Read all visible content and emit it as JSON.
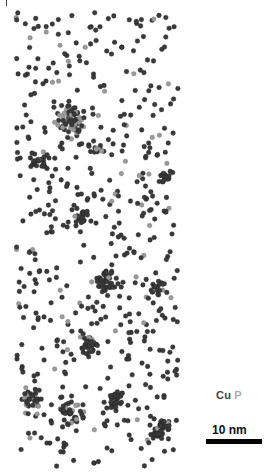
{
  "figure": {
    "legend": {
      "cu_label": "Cu",
      "p_label": "P",
      "cu_color": "#3a3a3a",
      "p_color": "#9a9a9a"
    },
    "scale_bar": {
      "label": "10 nm",
      "length_px": 56
    }
  },
  "atom_map": {
    "bounds": {
      "x0": 16,
      "x1": 178,
      "y0": 12,
      "y1": 468
    },
    "background_density": 520,
    "p_fraction_background": 0.1,
    "clusters": [
      {
        "x": 68,
        "y": 122,
        "r": 12,
        "n": 70,
        "p_fraction": 0.4
      },
      {
        "x": 38,
        "y": 160,
        "r": 9,
        "n": 25,
        "p_fraction": 0.1
      },
      {
        "x": 95,
        "y": 147,
        "r": 7,
        "n": 14,
        "p_fraction": 0.1
      },
      {
        "x": 165,
        "y": 176,
        "r": 5,
        "n": 16,
        "p_fraction": 0.0
      },
      {
        "x": 82,
        "y": 216,
        "r": 6,
        "n": 18,
        "p_fraction": 0.2
      },
      {
        "x": 105,
        "y": 282,
        "r": 9,
        "n": 45,
        "p_fraction": 0.1
      },
      {
        "x": 155,
        "y": 290,
        "r": 7,
        "n": 18,
        "p_fraction": 0.1
      },
      {
        "x": 88,
        "y": 345,
        "r": 8,
        "n": 30,
        "p_fraction": 0.1
      },
      {
        "x": 33,
        "y": 400,
        "r": 8,
        "n": 30,
        "p_fraction": 0.2
      },
      {
        "x": 70,
        "y": 412,
        "r": 8,
        "n": 25,
        "p_fraction": 0.15
      },
      {
        "x": 118,
        "y": 400,
        "r": 8,
        "n": 28,
        "p_fraction": 0.05
      },
      {
        "x": 160,
        "y": 430,
        "r": 9,
        "n": 40,
        "p_fraction": 0.1
      }
    ]
  }
}
